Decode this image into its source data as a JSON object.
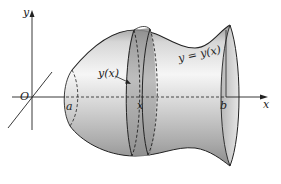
{
  "figure": {
    "colors": {
      "stroke": "#222222",
      "shade_light": "#f4f4f4",
      "shade_mid": "#c8c8c8",
      "shade_dark": "#8a8a8a",
      "slab": "#9a9a9a"
    }
  },
  "labels": {
    "y_axis": "y",
    "x_axis": "x",
    "origin": "O",
    "a": "a",
    "b": "b",
    "slab_x": "x",
    "radius": "y(x)",
    "curve": "y = y(x)"
  }
}
